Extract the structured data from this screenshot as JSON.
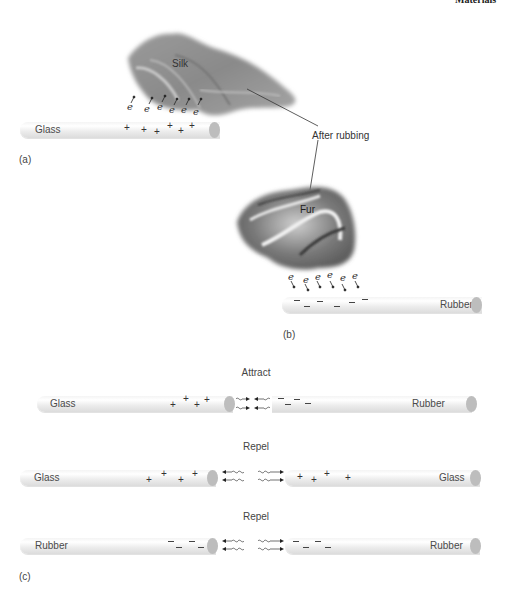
{
  "header": {
    "running_head": "Materials"
  },
  "panel_a": {
    "caption": "(a)",
    "cloth_label": "Silk",
    "rod_label": "Glass",
    "charges": [
      "+",
      "+",
      "+",
      "+",
      "+",
      "+"
    ],
    "electron_symbol": "e",
    "electron_count": 6
  },
  "callout": {
    "label": "After rubbing"
  },
  "panel_b": {
    "caption": "(b)",
    "cloth_label": "Fur",
    "rod_label": "Rubber",
    "charges": [
      "−",
      "−",
      "−",
      "−",
      "−",
      "−"
    ],
    "electron_symbol": "e",
    "electron_count": 6
  },
  "panel_c": {
    "caption": "(c)",
    "rows": [
      {
        "heading": "Attract",
        "left_label": "Glass",
        "left_charges": [
          "+",
          "+",
          "+",
          "+"
        ],
        "right_label": "Rubber",
        "right_charges": [
          "−",
          "−",
          "−",
          "−"
        ]
      },
      {
        "heading": "Repel",
        "left_label": "Glass",
        "left_charges": [
          "+",
          "+",
          "+",
          "+"
        ],
        "right_label": "Glass",
        "right_charges": [
          "+",
          "+",
          "+",
          "+"
        ]
      },
      {
        "heading": "Repel",
        "left_label": "Rubber",
        "left_charges": [
          "−",
          "−",
          "−"
        ],
        "right_label": "Rubber",
        "right_charges": [
          "−",
          "−",
          "−"
        ]
      }
    ]
  }
}
